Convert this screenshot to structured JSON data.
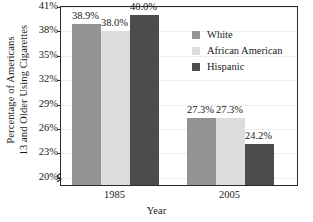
{
  "chart_data": {
    "type": "bar",
    "title": "",
    "xlabel": "Year",
    "ylabel": "Percentage of Americans 13 and Older Using Cigarettes",
    "ylabel_line1": "Percentage of Americans",
    "ylabel_line2": "13 and Older Using Cigarettes",
    "categories": [
      "1985",
      "2005"
    ],
    "ylim": [
      19,
      41
    ],
    "yticks": [
      "20%",
      "23%",
      "26%",
      "29%",
      "32%",
      "35%",
      "38%",
      "41%"
    ],
    "ytick_values": [
      20,
      23,
      26,
      29,
      32,
      35,
      38,
      41
    ],
    "grid": true,
    "axis_break": true,
    "legend_position": "upper right",
    "series": [
      {
        "name": "White",
        "color": "#939393",
        "values": [
          38.9,
          27.3
        ],
        "labels": [
          "38.9%",
          "27.3%"
        ]
      },
      {
        "name": "African American",
        "color": "#dcdcdc",
        "values": [
          38.0,
          27.3
        ],
        "labels": [
          "38.0%",
          "27.3%"
        ]
      },
      {
        "name": "Hispanic",
        "color": "#4c4c4c",
        "values": [
          40.0,
          24.2
        ],
        "labels": [
          "40.0%",
          "24.2%"
        ]
      }
    ]
  }
}
